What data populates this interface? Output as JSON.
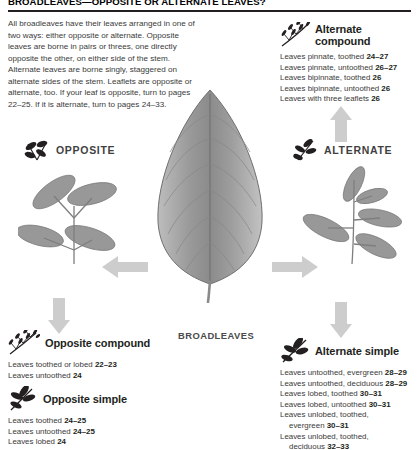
{
  "header": {
    "title": "BROADLEAVES—OPPOSITE OR ALTERNATE LEAVES?",
    "intro": "All broadleaves have their leaves arranged in one of two ways: either opposite or alternate. Opposite leaves are borne in pairs or threes, one directly opposite the other, on either side of the stem. Alternate leaves are borne singly, staggered on alternate sides of the stem. Leaflets are opposite or alternate, too. If your leaf is opposite, turn to pages 22–25. If it is alternate, turn to pages 24–33."
  },
  "center": {
    "broadleaves_label": "BROADLEAVES",
    "opposite_label": "OPPOSITE",
    "alternate_label": "ALTERNATE"
  },
  "sections": {
    "alternate_compound": {
      "title": "Alternate compound",
      "entries": [
        {
          "text": "Leaves pinnate, toothed ",
          "pages": "24–27"
        },
        {
          "text": "Leaves pinnate, untoothed ",
          "pages": "26–27"
        },
        {
          "text": "Leaves bipinnate, toothed ",
          "pages": "26"
        },
        {
          "text": "Leaves bipinnate, untoothed ",
          "pages": "26"
        },
        {
          "text": "Leaves with three leaflets ",
          "pages": "26"
        }
      ]
    },
    "alternate_simple": {
      "title": "Alternate simple",
      "entries": [
        {
          "text": "Leaves untoothed, evergreen ",
          "pages": "28–29"
        },
        {
          "text": "Leaves untoothed, deciduous ",
          "pages": "28–29"
        },
        {
          "text": "Leaves lobed, toothed ",
          "pages": "30–31"
        },
        {
          "text": "Leaves lobed, untoothed ",
          "pages": "30–31"
        },
        {
          "text": "Leaves unlobed, toothed,",
          "cont": "evergreen ",
          "pages": "30–31"
        },
        {
          "text": "Leaves unlobed, toothed,",
          "cont": "deciduous ",
          "pages": "32–33"
        }
      ]
    },
    "opposite_compound": {
      "title": "Opposite compound",
      "entries": [
        {
          "text": "Leaves toothed or lobed ",
          "pages": "22–23"
        },
        {
          "text": "Leaves untoothed ",
          "pages": "24"
        }
      ]
    },
    "opposite_simple": {
      "title": "Opposite simple",
      "entries": [
        {
          "text": "Leaves toothed ",
          "pages": "24–25"
        },
        {
          "text": "Leaves untoothed ",
          "pages": "24–25"
        },
        {
          "text": "Leaves lobed ",
          "pages": "24"
        }
      ]
    }
  },
  "icons": {
    "alternate_compound": "alternate-compound-sprig-icon",
    "alternate_simple": "alternate-simple-sprig-icon",
    "opposite_compound": "opposite-compound-sprig-icon",
    "opposite_simple": "opposite-simple-sprig-icon",
    "opposite_node": "opposite-sprig-icon",
    "alternate_node": "alternate-sprig-icon"
  },
  "colors": {
    "text": "#231f20",
    "body_text": "#3a3a3a",
    "arrow": "#c9c9c9",
    "leaf_photo": "#8e8e8e",
    "rule": "#231f20"
  }
}
